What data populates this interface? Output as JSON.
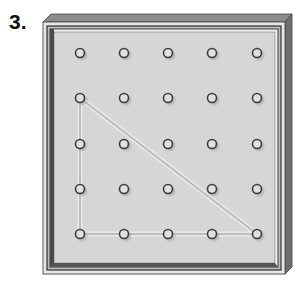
{
  "problem": {
    "number_label": "3."
  },
  "geoboard": {
    "rows": 5,
    "cols": 5,
    "peg_x": [
      80,
      124,
      168,
      212,
      257
    ],
    "peg_y": [
      53,
      98,
      144,
      189,
      234
    ],
    "rubber_band": {
      "shape": "right-triangle",
      "vertices": [
        [
          1,
          0
        ],
        [
          4,
          0
        ],
        [
          4,
          4
        ]
      ],
      "color": "#a9a9a9"
    },
    "colors": {
      "board": "#d6d6d6",
      "frame_dark": "#3a3a3a",
      "frame_side": "#7a7a7a",
      "frame_top": "#8c8c8c",
      "peg": "#3c3c3c"
    }
  }
}
